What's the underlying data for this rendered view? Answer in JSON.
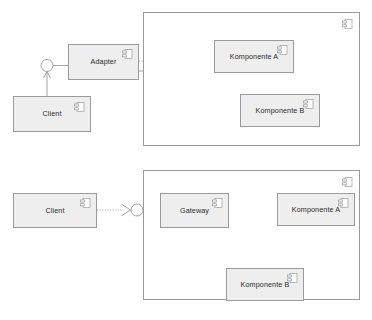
{
  "diagram": {
    "type": "uml-component-diagram",
    "colors": {
      "node_fill": "#eeeeee",
      "container_fill": "#ffffff",
      "stroke": "#9a9a9a",
      "text": "#2b2b2b",
      "connector": "#9a9a9a",
      "background": "#ffffff"
    },
    "variants": [
      {
        "id": "adapter-variant",
        "name": "Adapter",
        "container": {
          "name": "subsystem-container-top",
          "icon": "component-icon",
          "label": ""
        },
        "nodes": [
          {
            "id": "client-top",
            "label": "Client",
            "icon": "component-icon"
          },
          {
            "id": "adapter",
            "label": "Adapter",
            "icon": "component-icon"
          },
          {
            "id": "komponente-a-top",
            "label": "Komponente A",
            "icon": "component-icon"
          },
          {
            "id": "komponente-b-top",
            "label": "Komponente B",
            "icon": "component-icon"
          }
        ],
        "interfaces": [
          {
            "id": "iface-adapter-provided",
            "kind": "provided-ball",
            "label": ""
          },
          {
            "id": "iface-komponente-a-top",
            "kind": "ball-and-socket",
            "label": ""
          },
          {
            "id": "iface-komponente-b-top",
            "kind": "ball-and-socket",
            "label": ""
          }
        ],
        "connections": [
          {
            "from": "client-top",
            "to": "iface-adapter-provided",
            "style": "solid-with-arrow"
          },
          {
            "from": "adapter",
            "to": "iface-komponente-a-top",
            "style": "dotted-socket"
          },
          {
            "from": "adapter",
            "to": "iface-komponente-b-top",
            "style": "dotted-socket"
          },
          {
            "from": "iface-komponente-a-top",
            "to": "komponente-a-top",
            "style": "solid"
          },
          {
            "from": "iface-komponente-b-top",
            "to": "komponente-b-top",
            "style": "solid"
          }
        ]
      },
      {
        "id": "gateway-variant",
        "name": "Gateway",
        "container": {
          "name": "subsystem-container-bottom",
          "icon": "component-icon",
          "label": ""
        },
        "nodes": [
          {
            "id": "client-bottom",
            "label": "Client",
            "icon": "component-icon"
          },
          {
            "id": "gateway",
            "label": "Gateway",
            "icon": "component-icon"
          },
          {
            "id": "komponente-a-bottom",
            "label": "Komponente A",
            "icon": "component-icon"
          },
          {
            "id": "komponente-b-bottom",
            "label": "Komponente B",
            "icon": "component-icon"
          }
        ],
        "interfaces": [
          {
            "id": "iface-gateway-provided",
            "kind": "ball-and-socket",
            "label": ""
          },
          {
            "id": "iface-komponente-a-bottom",
            "kind": "ball-and-socket",
            "label": ""
          },
          {
            "id": "iface-komponente-b-bottom",
            "kind": "ball-and-socket",
            "label": ""
          }
        ],
        "connections": [
          {
            "from": "client-bottom",
            "to": "iface-gateway-provided",
            "style": "dotted-socket"
          },
          {
            "from": "iface-gateway-provided",
            "to": "gateway",
            "style": "solid"
          },
          {
            "from": "gateway",
            "to": "iface-komponente-a-bottom",
            "style": "dotted-socket"
          },
          {
            "from": "gateway",
            "to": "iface-komponente-b-bottom",
            "style": "dotted-socket"
          },
          {
            "from": "iface-komponente-a-bottom",
            "to": "komponente-a-bottom",
            "style": "solid"
          },
          {
            "from": "iface-komponente-b-bottom",
            "to": "komponente-b-bottom",
            "style": "solid"
          }
        ]
      }
    ]
  }
}
